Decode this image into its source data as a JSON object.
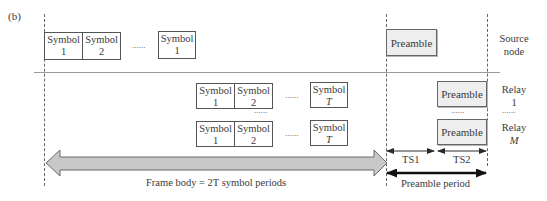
{
  "panel_label": "(b)",
  "source_row": {
    "symbols": [
      {
        "word": "Symbol",
        "index": "1"
      },
      {
        "word": "Symbol",
        "index": "2"
      },
      {
        "word": "Symbol",
        "index": "1"
      }
    ],
    "ellipsis": "......",
    "preamble": "Preamble",
    "node_label_line1": "Source",
    "node_label_line2": "node"
  },
  "relay_rows": [
    {
      "symbols": [
        {
          "word": "Symbol",
          "index": "1"
        },
        {
          "word": "Symbol",
          "index": "2"
        },
        {
          "word": "Symbol",
          "index": "T"
        }
      ],
      "ellipsis": "......",
      "preamble": "Preamble",
      "node_label_line1": "Relay",
      "node_label_line2": "1"
    },
    {
      "symbols": [
        {
          "word": "Symbol",
          "index": "1"
        },
        {
          "word": "Symbol",
          "index": "2"
        },
        {
          "word": "Symbol",
          "index": "T"
        }
      ],
      "ellipsis": "......",
      "preamble": "Preamble",
      "node_label_line1": "Relay",
      "node_label_line2": "M"
    }
  ],
  "between_rows_ellipsis": "......",
  "between_relays_label_ellipsis": "......",
  "timeslots": {
    "ts1": "TS1",
    "ts2": "TS2"
  },
  "frame_body_label": "Frame body = 2T symbol periods",
  "preamble_period_label": "Preamble period",
  "colors": {
    "arrow_fill": "#c8c8c8",
    "arrow_stroke": "#6a6a6a",
    "preamble_fill": "#eeeeee",
    "line": "#555555"
  }
}
